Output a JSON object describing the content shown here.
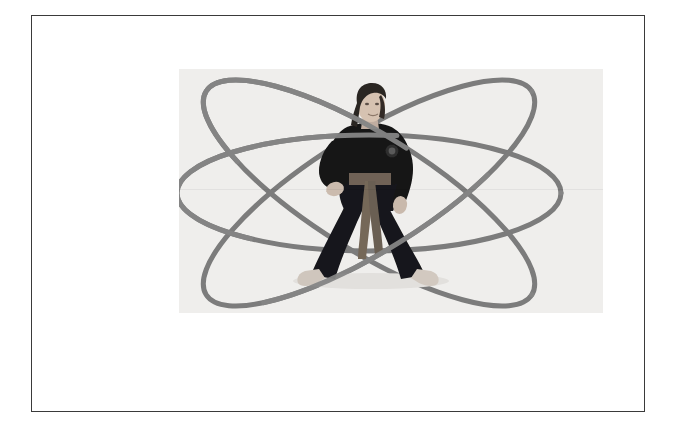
{
  "page": {
    "background_color": "#ffffff",
    "width": 681,
    "height": 441
  },
  "frame": {
    "name": "slide-border",
    "border_color": "#3a3a3a",
    "border_width_px": 1.5,
    "left": 31,
    "top": 15,
    "width": 614,
    "height": 397
  },
  "photo": {
    "caption": "",
    "alt_text": "Person in black martial arts gi standing in a wide horse stance, with three overlapping elliptical orbit lines drawn around them forming an atom symbol",
    "background_color": "#f1f0ee",
    "left": 178,
    "top": 68,
    "width": 424,
    "height": 244
  },
  "orbits": {
    "stroke_color": "#7b7b7b",
    "stroke_width": 5,
    "center_x": 190,
    "center_y": 124,
    "items": [
      {
        "name": "orbit-horizontal",
        "rx": 192,
        "ry": 58,
        "rotation_deg": 0
      },
      {
        "name": "orbit-tilted-right",
        "rx": 192,
        "ry": 58,
        "rotation_deg": 32
      },
      {
        "name": "orbit-tilted-left",
        "rx": 192,
        "ry": 58,
        "rotation_deg": -32
      }
    ]
  },
  "figure": {
    "name": "martial-artist",
    "uniform_color": "#141414",
    "belt_color": "#6f6256",
    "skin_color": "#d8c3b2",
    "hair_color": "#2a2522",
    "foot_color": "#cfc6bd",
    "stance": "horse stance",
    "emblem": {
      "name": "gi-chest-patch",
      "color": "#3b3b3b"
    }
  },
  "colors": {
    "page_white": "#ffffff",
    "frame_dark": "#3a3a3a",
    "photo_bg": "#f1f0ee",
    "orbit_gray": "#7b7b7b",
    "gi_black": "#141414",
    "belt_brown": "#6f6256"
  }
}
